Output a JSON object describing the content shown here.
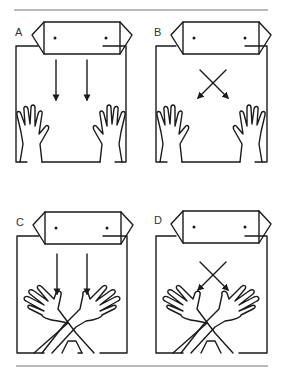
{
  "figure": {
    "panels": [
      {
        "id": "A",
        "label": "A",
        "arrows": "parallel-down",
        "hands": "open-apart"
      },
      {
        "id": "B",
        "label": "B",
        "arrows": "crossed-down",
        "hands": "open-apart"
      },
      {
        "id": "C",
        "label": "C",
        "arrows": "parallel-down",
        "hands": "crossed-wrists"
      },
      {
        "id": "D",
        "label": "D",
        "arrows": "crossed-down",
        "hands": "crossed-wrists"
      }
    ],
    "colors": {
      "line": "#1a1a1a",
      "rule": "#777777",
      "background": "#ffffff"
    }
  }
}
